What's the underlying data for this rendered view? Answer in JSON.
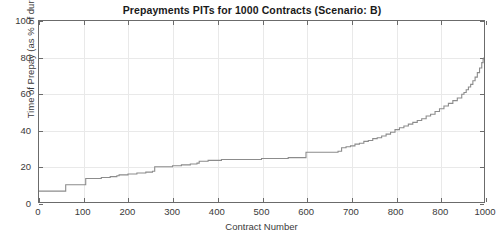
{
  "chart_data": {
    "type": "line",
    "title": "Prepayments PITs for 1000 Contracts (Scenario: B)",
    "xlabel": "Contract Number",
    "ylabel": "Time of Prepay (as % of duration)",
    "xlim": [
      0,
      1000
    ],
    "ylim": [
      0,
      100
    ],
    "grid": true,
    "legend": null,
    "line_color": "#8c8c8c",
    "axis_color": "#6b6b6b",
    "grid_color": "#e9e9e9",
    "background_color": "#ffffff",
    "xticks": [
      0,
      100,
      200,
      300,
      400,
      500,
      600,
      700,
      800,
      900,
      1000
    ],
    "xtick_labels": [
      "0",
      "100",
      "200",
      "300",
      "400",
      "500",
      "600",
      "700",
      "800",
      "800",
      "1000"
    ],
    "yticks": [
      0,
      20,
      40,
      60,
      80,
      100
    ],
    "ytick_labels": [
      "0",
      "20",
      "40",
      "60",
      "80",
      "100"
    ],
    "series": [
      {
        "name": "Prepayment PIT (sorted)",
        "step": "post",
        "x": [
          0,
          20,
          40,
          55,
          60,
          80,
          100,
          105,
          120,
          140,
          160,
          175,
          180,
          200,
          220,
          240,
          255,
          260,
          280,
          300,
          320,
          340,
          355,
          360,
          380,
          400,
          410,
          420,
          440,
          460,
          480,
          500,
          520,
          540,
          560,
          580,
          595,
          600,
          620,
          640,
          660,
          672,
          680,
          690,
          700,
          710,
          720,
          730,
          740,
          750,
          760,
          770,
          780,
          790,
          800,
          810,
          820,
          830,
          840,
          850,
          860,
          870,
          880,
          890,
          900,
          910,
          920,
          930,
          940,
          950,
          955,
          960,
          965,
          970,
          975,
          980,
          985,
          990,
          995,
          998,
          1000
        ],
        "y": [
          6.0,
          6.0,
          6.0,
          6.0,
          9.5,
          9.5,
          9.5,
          13.0,
          13.0,
          13.5,
          14.0,
          14.5,
          15.0,
          15.5,
          16.0,
          16.5,
          17.0,
          19.5,
          19.5,
          20.0,
          20.5,
          21.0,
          21.5,
          22.5,
          23.0,
          23.0,
          23.5,
          23.5,
          23.5,
          23.5,
          23.5,
          24.0,
          24.0,
          24.0,
          24.5,
          24.5,
          24.5,
          27.5,
          27.5,
          27.5,
          27.5,
          28.0,
          30.0,
          30.5,
          31.0,
          32.0,
          32.5,
          33.5,
          34.0,
          35.0,
          35.5,
          36.5,
          37.5,
          38.5,
          40.0,
          41.0,
          42.0,
          43.0,
          44.0,
          45.0,
          46.0,
          47.5,
          48.5,
          50.0,
          51.5,
          53.0,
          54.5,
          56.0,
          57.5,
          59.5,
          60.5,
          62.0,
          63.5,
          65.0,
          67.0,
          69.0,
          71.5,
          74.0,
          77.0,
          79.0,
          80.0
        ]
      }
    ]
  }
}
